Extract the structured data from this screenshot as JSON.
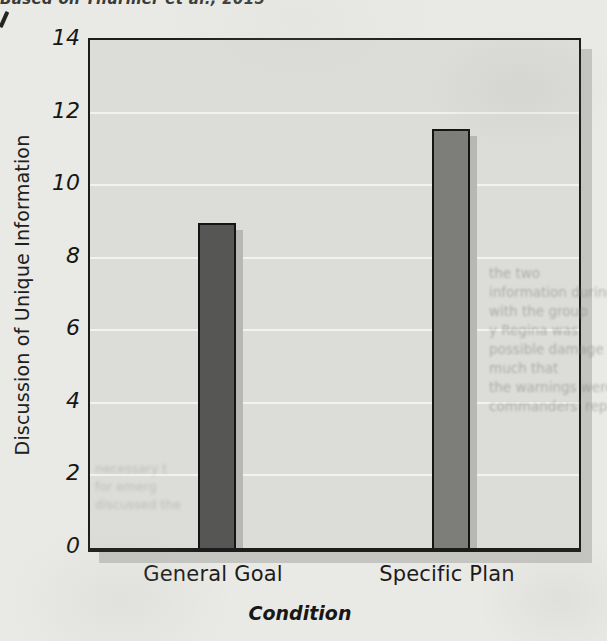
{
  "page": {
    "caption_top": "Based on Thürmer et al., 2015"
  },
  "chart_data": {
    "type": "bar",
    "title": "",
    "categories": [
      "General Goal",
      "Specific Plan"
    ],
    "values": [
      8.9,
      11.5
    ],
    "xlabel": "Condition",
    "ylabel": "Discussion of Unique Information",
    "ylim": [
      0,
      14
    ],
    "yticks": [
      14,
      12,
      10,
      8,
      6,
      4,
      2,
      0
    ],
    "grid": "horizontal-white-gridlines",
    "legend": "none",
    "bar_colors": [
      "#565654",
      "#7d7d7a"
    ],
    "plot_bg": "#dcdcd9",
    "frame_color": "#1c1c1c",
    "page_bg": "#e9e9e6"
  },
  "bleedthrough": {
    "right_fragments": [
      "the two",
      "information during",
      "with the group",
      "y Regina was",
      "possible damage in",
      "much that",
      "the warnings were",
      "commanders' report"
    ],
    "bottom_left_fragments": [
      "necessary t",
      "for emerg",
      "discussed the"
    ]
  }
}
